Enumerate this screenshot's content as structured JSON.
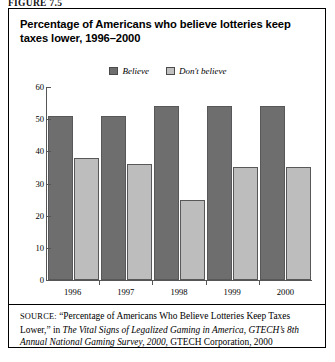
{
  "figure": {
    "label": "FIGURE 7.5"
  },
  "chart_data": {
    "type": "bar",
    "title": "Percentage of Americans who believe lotteries keep taxes lower, 1996–2000",
    "xlabel": "",
    "ylabel": "",
    "ylim": [
      0,
      60
    ],
    "yticks": [
      0,
      10,
      20,
      30,
      40,
      50,
      60
    ],
    "grid": false,
    "legend_position": "top-center",
    "categories": [
      "1996",
      "1997",
      "1998",
      "1999",
      "2000"
    ],
    "series": [
      {
        "name": "Believe",
        "color": "#6e6e6e",
        "values": [
          51,
          51,
          54,
          54,
          54
        ]
      },
      {
        "name": "Don't believe",
        "color": "#bdbdbd",
        "values": [
          38,
          36,
          25,
          35,
          35
        ]
      }
    ]
  },
  "source": {
    "prefix": "SOURCE:",
    "part1": " “Percentage of Americans Who Believe Lotteries Keep Taxes Lower,” in ",
    "italic1": "The Vital Signs of Legalized Gaming in America, GTECH’s 8th Annual National Gaming Survey, 2000",
    "part2": ", GTECH Corporation, 2000"
  }
}
